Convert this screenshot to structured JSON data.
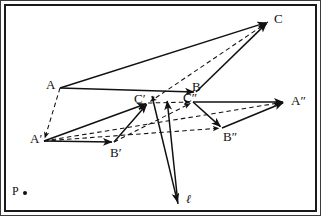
{
  "figure": {
    "kind": "geometric-diagram",
    "background_color": "#ffffff",
    "stroke_color": "#111111",
    "frame": {
      "outer_color": "#3a3a3a",
      "inner_color": "#1a1a1a"
    }
  },
  "labels": {
    "A": {
      "text": "A",
      "x": 46,
      "y": 78
    },
    "B": {
      "text": "B",
      "x": 192,
      "y": 80
    },
    "C": {
      "text": "C",
      "x": 274,
      "y": 12
    },
    "Ap": {
      "text": "A′",
      "x": 30,
      "y": 132
    },
    "Bp": {
      "text": "B′",
      "x": 110,
      "y": 146
    },
    "Cp": {
      "text": "C′",
      "x": 134,
      "y": 92
    },
    "App": {
      "text": "A″",
      "x": 291,
      "y": 94
    },
    "Bpp": {
      "text": "B″",
      "x": 223,
      "y": 130
    },
    "Cpp": {
      "text": "C″",
      "x": 183,
      "y": 91
    },
    "P": {
      "text": "P",
      "x": 12,
      "y": 185
    },
    "l": {
      "text": "ℓ",
      "x": 186,
      "y": 193
    }
  },
  "points": {
    "A": {
      "x": 60,
      "y": 88
    },
    "B": {
      "x": 196,
      "y": 92
    },
    "C": {
      "x": 268,
      "y": 22
    },
    "Ap": {
      "x": 44,
      "y": 141
    },
    "Bp": {
      "x": 114,
      "y": 142
    },
    "Cp": {
      "x": 148,
      "y": 103
    },
    "App": {
      "x": 285,
      "y": 102
    },
    "Bpp": {
      "x": 222,
      "y": 128
    },
    "Cpp": {
      "x": 193,
      "y": 102
    },
    "P": {
      "x": 25,
      "y": 193
    },
    "l_tip": {
      "x": 178,
      "y": 204
    },
    "l_tail": {
      "x": 152,
      "y": 96
    },
    "mid_arrow_tip": {
      "x": 167,
      "y": 99
    }
  },
  "segments": {
    "solid": [
      {
        "name": "A-C",
        "from": "A",
        "to": "C",
        "arrow": true
      },
      {
        "name": "A-B",
        "from": "A",
        "to": "B",
        "arrow": true
      },
      {
        "name": "B-C",
        "from": "B",
        "to": "C",
        "arrow": true
      },
      {
        "name": "Ap-Cp",
        "from": "Ap",
        "to": "Cp",
        "arrow": true
      },
      {
        "name": "Ap-Bp",
        "from": "Ap",
        "to": "Bp",
        "arrow": true
      },
      {
        "name": "Bp-Cp",
        "from": "Bp",
        "to": "Cp",
        "arrow": true
      },
      {
        "name": "Cpp-App",
        "from": "Cpp",
        "to": "App",
        "arrow": true
      },
      {
        "name": "Cpp-Bpp",
        "from": "Cpp",
        "to": "Bpp",
        "arrow": true
      },
      {
        "name": "Bpp-App",
        "from": "Bpp",
        "to": "App",
        "arrow": true
      },
      {
        "name": "l-axis",
        "from": "l_tail",
        "to": "l_tip",
        "arrow": true
      },
      {
        "name": "mid-arrow",
        "from": "l_tip",
        "to": "mid_arrow_tip",
        "arrow": true
      }
    ],
    "dashed": [
      {
        "name": "A-Ap",
        "from": "A",
        "to": "Ap",
        "arrow": true
      },
      {
        "name": "C-Cp",
        "from": "C",
        "to": "Cp",
        "arrow": true
      },
      {
        "name": "Cp-Cpp",
        "from": "Cp",
        "to": "Cpp",
        "arrow": true
      },
      {
        "name": "Ap-App",
        "from": "Ap",
        "to": "App",
        "arrow": true
      },
      {
        "name": "Ap-Bpp",
        "from": "Ap",
        "to": "Bpp",
        "arrow": true
      },
      {
        "name": "Bp-Cpp",
        "from": "Bp",
        "to": "Cpp",
        "arrow": true
      }
    ]
  }
}
